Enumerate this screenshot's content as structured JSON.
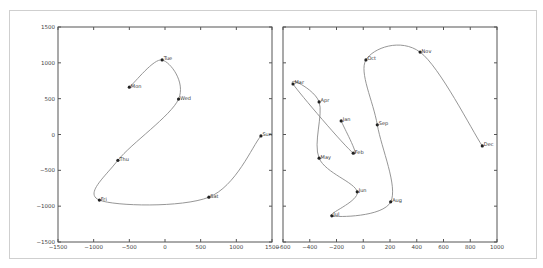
{
  "chart_data": [
    {
      "type": "line",
      "title": "",
      "xlabel": "",
      "ylabel": "",
      "xlim": [
        -1500,
        1500
      ],
      "ylim": [
        -1500,
        1500
      ],
      "grid": false,
      "xticks": [
        -1500,
        -1000,
        -500,
        0,
        500,
        1000,
        1500
      ],
      "yticks": [
        -1500,
        -1000,
        -500,
        0,
        500,
        1000,
        1500
      ],
      "xtick_labels": [
        "−1500",
        "−1000",
        "−500",
        "0",
        "500",
        "1000",
        "1500"
      ],
      "ytick_labels": [
        "−1500",
        "−1000",
        "−500",
        "0",
        "500",
        "1000",
        "1500"
      ],
      "points": [
        {
          "label": "Mon",
          "x": -500,
          "y": 660
        },
        {
          "label": "Tue",
          "x": -40,
          "y": 1040
        },
        {
          "label": "Wed",
          "x": 190,
          "y": 495
        },
        {
          "label": "Thu",
          "x": -660,
          "y": -360
        },
        {
          "label": "Fri",
          "x": -920,
          "y": -915
        },
        {
          "label": "Sat",
          "x": 615,
          "y": -875
        },
        {
          "label": "Sun",
          "x": 1345,
          "y": -20
        }
      ]
    },
    {
      "type": "line",
      "title": "",
      "xlabel": "",
      "ylabel": "",
      "xlim": [
        -600,
        1000
      ],
      "ylim": [
        -1500,
        1500
      ],
      "grid": false,
      "xticks": [
        -600,
        -400,
        -200,
        0,
        200,
        400,
        600,
        800,
        1000
      ],
      "yticks": [
        -1500,
        -1000,
        -500,
        0,
        500,
        1000,
        1500
      ],
      "xtick_labels": [
        "−600",
        "−400",
        "−200",
        "0",
        "200",
        "400",
        "600",
        "800",
        "1000"
      ],
      "ytick_labels": [],
      "points": [
        {
          "label": "Jan",
          "x": -165,
          "y": 190
        },
        {
          "label": "Feb",
          "x": -75,
          "y": -260
        },
        {
          "label": "Mar",
          "x": -525,
          "y": 705
        },
        {
          "label": "Apr",
          "x": -330,
          "y": 455
        },
        {
          "label": "May",
          "x": -330,
          "y": -330
        },
        {
          "label": "Jun",
          "x": -45,
          "y": -800
        },
        {
          "label": "Jul",
          "x": -235,
          "y": -1135
        },
        {
          "label": "Aug",
          "x": 205,
          "y": -940
        },
        {
          "label": "Sep",
          "x": 105,
          "y": 135
        },
        {
          "label": "Oct",
          "x": 20,
          "y": 1040
        },
        {
          "label": "Nov",
          "x": 425,
          "y": 1150
        },
        {
          "label": "Dec",
          "x": 890,
          "y": -160
        }
      ]
    }
  ],
  "layout": {
    "axes": [
      {
        "left": 58,
        "top": 27,
        "width": 214,
        "height": 215,
        "show_y_labels": true
      },
      {
        "left": 283,
        "top": 27,
        "width": 214,
        "height": 215,
        "show_y_labels": false
      }
    ]
  }
}
